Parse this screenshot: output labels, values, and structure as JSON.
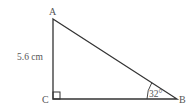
{
  "diagram": {
    "type": "right-triangle",
    "vertices": {
      "A": {
        "label": "A"
      },
      "B": {
        "label": "B"
      },
      "C": {
        "label": "C"
      }
    },
    "side_AC_label": "5.6 cm",
    "angle_B_label": "32°",
    "right_angle_at": "C",
    "colors": {
      "line": "#333333",
      "text": "#555555"
    }
  }
}
